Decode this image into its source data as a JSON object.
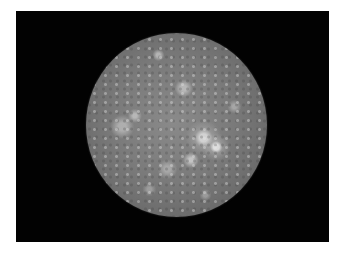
{
  "image": {
    "subject": "Cratered moon (Callisto) on black background",
    "background_color": "#020202",
    "page_background": "#ffffff",
    "moon_base_color": "#7a7a7a",
    "highlight_color": "#e6e6e6"
  },
  "caption": {
    "text": ""
  }
}
